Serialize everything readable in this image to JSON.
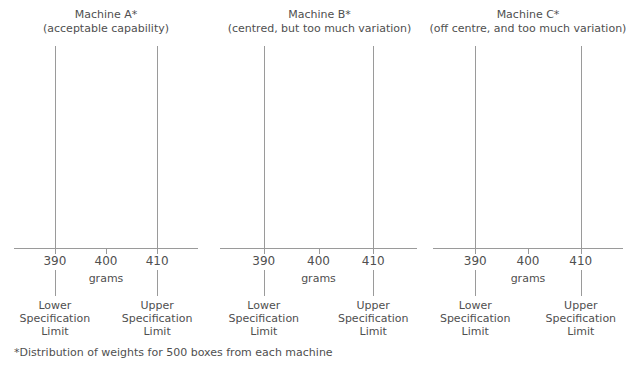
{
  "footnote": "*Distribution of weights for 500 boxes from each machine",
  "axis": {
    "units_label": "grams",
    "tick_labels": [
      "390",
      "400",
      "410"
    ],
    "tick_values": [
      390,
      400,
      410
    ]
  },
  "spec_labels": {
    "lower": "Lower\nSpecification\nLimit",
    "lower_l1": "Lower",
    "lower_l2": "Specification",
    "lower_l3": "Limit",
    "upper_l1": "Upper",
    "upper_l2": "Specification",
    "upper_l3": "Limit"
  },
  "colors": {
    "bar_a": "#e6e6e6",
    "bar_b": "#cfcfcf",
    "bar_c": "#b3b3b3",
    "bar_stroke": "#9d9d9d",
    "axis": "#9a9a9a",
    "text": "#4f4f4f"
  },
  "chart_data": [
    {
      "type": "bar",
      "title": "Machine A*",
      "subtitle": "(acceptable capability)",
      "xlabel": "grams",
      "ylabel": "",
      "xlim": [
        382,
        418
      ],
      "ylim": [
        0,
        120
      ],
      "grid": false,
      "legend": "none",
      "bin_width": 2,
      "bin_starts": [
        391,
        393,
        395,
        397,
        399,
        401,
        403
      ],
      "categories": [
        "391-393",
        "393-395",
        "395-397",
        "397-399",
        "399-401",
        "401-403",
        "403-405"
      ],
      "values": [
        8,
        33,
        90,
        112,
        95,
        56,
        26
      ],
      "lower_spec_limit": 390,
      "upper_spec_limit": 410,
      "annotations": [
        "Lower Specification Limit",
        "Upper Specification Limit"
      ]
    },
    {
      "type": "bar",
      "title": "Machine B*",
      "subtitle": "(centred, but too much variation)",
      "xlabel": "grams",
      "ylabel": "",
      "xlim": [
        382,
        418
      ],
      "ylim": [
        0,
        120
      ],
      "grid": false,
      "legend": "none",
      "bin_width": 2,
      "bin_starts": [
        385,
        387,
        389,
        391,
        393,
        395,
        397,
        399,
        401,
        403,
        405,
        407,
        409,
        411,
        413
      ],
      "categories": [
        "385-387",
        "387-389",
        "389-391",
        "391-393",
        "393-395",
        "395-397",
        "397-399",
        "399-401",
        "401-403",
        "403-405",
        "405-407",
        "407-409",
        "409-411",
        "411-413",
        "413-415"
      ],
      "values": [
        5,
        17,
        33,
        51,
        75,
        94,
        111,
        120,
        101,
        68,
        45,
        32,
        21,
        14,
        6
      ],
      "lower_spec_limit": 390,
      "upper_spec_limit": 410,
      "annotations": [
        "Lower Specification Limit",
        "Upper Specification Limit"
      ]
    },
    {
      "type": "bar",
      "title": "Machine C*",
      "subtitle": "(off centre, and too much variation)",
      "xlabel": "grams",
      "ylabel": "",
      "xlim": [
        382,
        418
      ],
      "ylim": [
        0,
        120
      ],
      "grid": false,
      "legend": "none",
      "bin_width": 2,
      "bin_starts": [
        383,
        385,
        387,
        389,
        391,
        393,
        395,
        397,
        399,
        401,
        403
      ],
      "categories": [
        "383-385",
        "385-387",
        "387-389",
        "389-391",
        "391-393",
        "393-395",
        "395-397",
        "397-399",
        "399-401",
        "401-403",
        "403-405"
      ],
      "values": [
        10,
        33,
        57,
        76,
        98,
        120,
        89,
        60,
        35,
        20,
        9
      ],
      "lower_spec_limit": 390,
      "upper_spec_limit": 410,
      "annotations": [
        "Lower Specification Limit",
        "Upper Specification Limit"
      ]
    }
  ]
}
